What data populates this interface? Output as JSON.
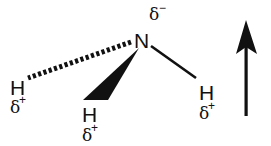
{
  "molecule": {
    "central_atom": {
      "label": "N",
      "charge_symbol": "δ",
      "charge_sign": "−"
    },
    "hydrogens": [
      {
        "id": "left",
        "label": "H",
        "charge_symbol": "δ",
        "charge_sign": "+",
        "bond": "dashed"
      },
      {
        "id": "middle",
        "label": "H",
        "charge_symbol": "δ",
        "charge_sign": "+",
        "bond": "wedge"
      },
      {
        "id": "right",
        "label": "H",
        "charge_symbol": "δ",
        "charge_sign": "+",
        "bond": "plain"
      }
    ]
  },
  "dipole_arrow": {
    "direction": "up"
  },
  "colors": {
    "ink": "#111111",
    "background": "#ffffff"
  }
}
